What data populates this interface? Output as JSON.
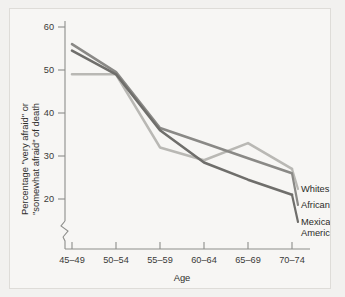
{
  "chart_data": {
    "type": "line",
    "title": "",
    "xlabel": "Age",
    "ylabel": "Percentage \"very afraid\" or \"somewhat afraid\" of death",
    "ylabel_line1": "Percentage \"very afraid\" or",
    "ylabel_line2": "\"somewhat afraid\" of death",
    "categories": [
      "45–49",
      "50–54",
      "55–59",
      "60–64",
      "65–69",
      "70–74"
    ],
    "x": [
      "45–49",
      "50–54",
      "55–59",
      "60–64",
      "65–69",
      "70–74"
    ],
    "yticks": [
      20,
      30,
      40,
      50,
      60
    ],
    "ytick_labels": [
      "20",
      "30",
      "40",
      "50",
      "60"
    ],
    "ylim": [
      17,
      62
    ],
    "y_axis_break": true,
    "grid": false,
    "legend_position": "right-inline",
    "series": [
      {
        "name": "Whites",
        "color": "#b9b8b4",
        "values": [
          49,
          49,
          32,
          29,
          33,
          27
        ]
      },
      {
        "name": "African Americans",
        "color": "#8a8986",
        "values": [
          56,
          49.5,
          36.5,
          33,
          29.5,
          26
        ]
      },
      {
        "name": "Mexican Americans",
        "color": "#6f6e6b",
        "values": [
          54.5,
          49,
          36,
          28.5,
          24.5,
          21
        ]
      }
    ]
  },
  "axes": {
    "x_title": "Age",
    "y_title_line1": "Percentage \"very afraid\" or",
    "y_title_line2": "\"somewhat afraid\" of death"
  },
  "legend": {
    "items": [
      {
        "label": "Whites"
      },
      {
        "label": "African Americans"
      },
      {
        "label": "Mexican"
      },
      {
        "label": "Americans"
      }
    ],
    "whites": "Whites",
    "african_americans": "African Americans",
    "mexican_line1": "Mexican",
    "mexican_line2": "Americans"
  },
  "colors": {
    "background": "#f2f1ef",
    "panel": "#f7f6f4",
    "axis": "#8d8d8a",
    "text": "#2b2b29",
    "series_whites": "#b9b8b4",
    "series_african_americans": "#8a8986",
    "series_mexican_americans": "#6f6e6b"
  }
}
